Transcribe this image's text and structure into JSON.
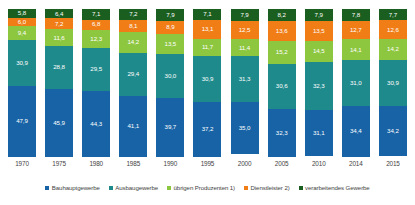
{
  "chart_data": {
    "type": "bar",
    "stacked": true,
    "title": "",
    "subtitle": "",
    "xlabel": "",
    "ylabel": "",
    "ylim": [
      0,
      100
    ],
    "grid": false,
    "legend_position": "bottom",
    "categories": [
      "1970",
      "1975",
      "1980",
      "1985",
      "1990",
      "1995",
      "2000",
      "2005",
      "2010",
      "2014",
      "2015"
    ],
    "series": [
      {
        "name": "Bauhauptgewerbe",
        "color": "#1a5e20",
        "values": [
          5.8,
          6.4,
          7.1,
          7.2,
          7.9,
          7.1,
          7.9,
          8.2,
          7.9,
          7.8,
          7.7
        ]
      },
      {
        "name": "Ausbaugewerbe",
        "color": "#f07d16",
        "values": [
          6.0,
          7.2,
          6.8,
          8.1,
          8.9,
          13.1,
          12.5,
          13.6,
          13.5,
          12.7,
          12.6
        ]
      },
      {
        "name": "übrigen Produzenten 1)",
        "color": "#8dc63f",
        "values": [
          9.4,
          11.6,
          12.3,
          14.2,
          13.5,
          11.7,
          11.4,
          15.2,
          14.5,
          14.1,
          14.2
        ]
      },
      {
        "name": "Dienstleister 2)",
        "color": "#1f8a8c",
        "values": [
          30.9,
          28.8,
          29.5,
          29.4,
          30.0,
          30.9,
          31.3,
          30.6,
          32.3,
          31.0,
          30.9
        ]
      },
      {
        "name": "verarbeitendes Gewerbe",
        "color": "#1763a6",
        "values": [
          47.9,
          45.9,
          44.3,
          41.1,
          39.7,
          37.2,
          35.0,
          32.3,
          31.1,
          34.4,
          34.2
        ]
      }
    ],
    "legend_entries": [
      {
        "label": "Bauhauptgewerbe",
        "color": "#1763a6"
      },
      {
        "label": "Ausbaugewerbe",
        "color": "#1f8a8c"
      },
      {
        "label": "übrigen Produzenten 1)",
        "color": "#8dc63f"
      },
      {
        "label": "Dienstleister 2)",
        "color": "#f07d16"
      },
      {
        "label": "verarbeitendes Gewerbe",
        "color": "#1a5e20"
      }
    ]
  }
}
